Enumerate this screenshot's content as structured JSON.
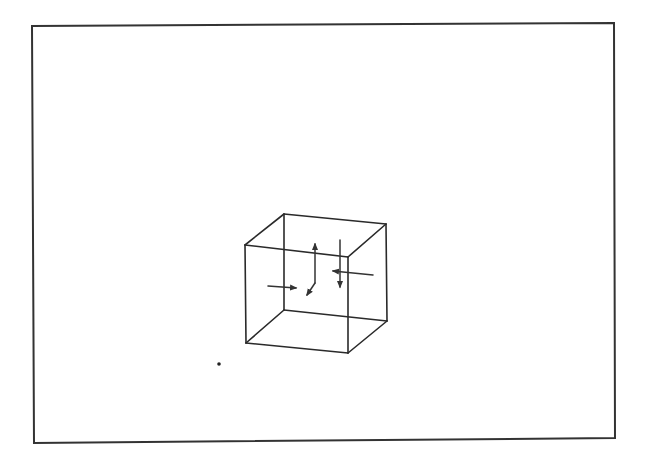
{
  "figure": {
    "type": "necker-cube-with-arrows",
    "background": "#ffffff",
    "stroke_color": "#2a2a2a",
    "frame": {
      "corners": [
        [
          32,
          26
        ],
        [
          614,
          23
        ],
        [
          615,
          438
        ],
        [
          34,
          443
        ]
      ]
    },
    "cube": {
      "vertices": {
        "front_top_left": [
          245,
          245
        ],
        "front_top_right": [
          348,
          257
        ],
        "front_bottom_left": [
          246,
          343
        ],
        "front_bottom_right": [
          348,
          353
        ],
        "back_top_left": [
          284,
          214
        ],
        "back_top_right": [
          386,
          224
        ],
        "back_bottom_left": [
          284,
          310
        ],
        "back_bottom_right": [
          387,
          321
        ]
      },
      "edges": [
        [
          "front_top_left",
          "front_top_right"
        ],
        [
          "front_top_right",
          "front_bottom_right"
        ],
        [
          "front_bottom_right",
          "front_bottom_left"
        ],
        [
          "front_bottom_left",
          "front_top_left"
        ],
        [
          "back_top_left",
          "back_top_right"
        ],
        [
          "back_top_right",
          "back_bottom_right"
        ],
        [
          "back_bottom_right",
          "back_bottom_left"
        ],
        [
          "back_bottom_left",
          "back_top_left"
        ],
        [
          "front_top_left",
          "back_top_left"
        ],
        [
          "front_top_right",
          "back_top_right"
        ],
        [
          "front_bottom_left",
          "back_bottom_left"
        ],
        [
          "front_bottom_right",
          "back_bottom_right"
        ]
      ]
    },
    "arrows": [
      {
        "name": "arrow-right",
        "from": [
          268,
          286
        ],
        "to": [
          296,
          288
        ]
      },
      {
        "name": "arrow-up",
        "from": [
          315,
          283
        ],
        "to": [
          315,
          244
        ]
      },
      {
        "name": "arrow-down-left",
        "from": [
          315,
          283
        ],
        "to": [
          307,
          295
        ]
      },
      {
        "name": "arrow-down",
        "from": [
          340,
          240
        ],
        "to": [
          340,
          287
        ]
      },
      {
        "name": "arrow-left",
        "from": [
          373,
          275
        ],
        "to": [
          333,
          271
        ]
      }
    ],
    "dot": {
      "center": [
        219,
        364
      ],
      "radius": 1.8
    }
  }
}
